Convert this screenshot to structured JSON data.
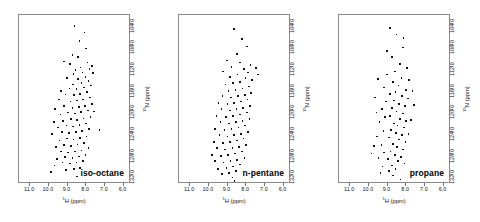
{
  "figure": {
    "panel_count": 3
  },
  "axes": {
    "x_title_pre": "1",
    "x_title_main": "H (ppm)",
    "y_title_pre": "15",
    "y_title_main": "N (ppm)",
    "x_ticks": [
      "11.0",
      "10.0",
      "9.0",
      "8.0",
      "7.0",
      "6.0"
    ],
    "x_tick_values": [
      11.0,
      10.0,
      9.0,
      8.0,
      7.0,
      6.0
    ],
    "y_ticks": [
      "104.0",
      "108.0",
      "112.0",
      "116.0",
      "120.0",
      "124.0",
      "128.0",
      "132.0"
    ],
    "y_tick_values": [
      104.0,
      108.0,
      112.0,
      116.0,
      120.0,
      124.0,
      128.0,
      132.0
    ],
    "x_range": [
      11.6,
      5.6
    ],
    "y_range": [
      102.4,
      133.6
    ],
    "x_inverted": true,
    "y_inverted": true
  },
  "chart_data": {
    "type": "scatter",
    "title": "",
    "xlabel": "1H (ppm)",
    "ylabel": "15N (ppm)",
    "xlim": [
      11.6,
      5.6
    ],
    "ylim": [
      133.6,
      102.4
    ],
    "grid": false,
    "legend": "none",
    "marker": "dot",
    "marker_color": "#111111",
    "panels": [
      {
        "label": "iso-octane",
        "point_count": 96,
        "points": [
          [
            8.62,
            104.4
          ],
          [
            8.1,
            105.6
          ],
          [
            8.36,
            107.2
          ],
          [
            8.02,
            108.6
          ],
          [
            8.74,
            109.8
          ],
          [
            8.45,
            110.2
          ],
          [
            9.18,
            111.0
          ],
          [
            8.86,
            111.4
          ],
          [
            7.92,
            111.2
          ],
          [
            7.7,
            111.8
          ],
          [
            8.3,
            112.1
          ],
          [
            8.58,
            112.6
          ],
          [
            7.82,
            112.4
          ],
          [
            8.2,
            113.0
          ],
          [
            8.68,
            113.3
          ],
          [
            7.62,
            113.1
          ],
          [
            8.04,
            113.8
          ],
          [
            8.44,
            114.2
          ],
          [
            9.02,
            114.0
          ],
          [
            7.88,
            114.6
          ],
          [
            8.26,
            115.0
          ],
          [
            8.72,
            115.2
          ],
          [
            7.74,
            115.4
          ],
          [
            8.12,
            115.8
          ],
          [
            8.52,
            116.1
          ],
          [
            8.9,
            116.0
          ],
          [
            9.34,
            116.4
          ],
          [
            7.96,
            116.6
          ],
          [
            8.34,
            117.0
          ],
          [
            8.66,
            117.2
          ],
          [
            9.1,
            117.1
          ],
          [
            7.8,
            117.6
          ],
          [
            8.18,
            118.0
          ],
          [
            8.5,
            118.2
          ],
          [
            8.84,
            118.4
          ],
          [
            9.46,
            118.0
          ],
          [
            7.68,
            118.8
          ],
          [
            8.06,
            119.2
          ],
          [
            8.4,
            119.4
          ],
          [
            8.74,
            119.6
          ],
          [
            9.2,
            119.2
          ],
          [
            9.66,
            119.8
          ],
          [
            7.9,
            120.0
          ],
          [
            8.28,
            120.3
          ],
          [
            8.6,
            120.6
          ],
          [
            8.96,
            120.4
          ],
          [
            9.38,
            120.8
          ],
          [
            7.76,
            121.2
          ],
          [
            8.14,
            121.5
          ],
          [
            8.48,
            121.8
          ],
          [
            8.82,
            121.6
          ],
          [
            9.24,
            122.0
          ],
          [
            9.72,
            122.2
          ],
          [
            8.0,
            122.4
          ],
          [
            8.36,
            122.7
          ],
          [
            8.7,
            123.0
          ],
          [
            9.06,
            122.8
          ],
          [
            9.52,
            123.2
          ],
          [
            7.84,
            123.4
          ],
          [
            8.22,
            123.8
          ],
          [
            8.56,
            124.0
          ],
          [
            8.92,
            124.2
          ],
          [
            9.3,
            124.0
          ],
          [
            9.84,
            124.4
          ],
          [
            7.98,
            124.8
          ],
          [
            8.34,
            125.1
          ],
          [
            8.68,
            125.4
          ],
          [
            9.04,
            125.2
          ],
          [
            9.44,
            125.6
          ],
          [
            8.12,
            126.0
          ],
          [
            8.46,
            126.3
          ],
          [
            8.8,
            126.6
          ],
          [
            9.18,
            126.4
          ],
          [
            9.62,
            126.8
          ],
          [
            7.88,
            127.0
          ],
          [
            8.26,
            127.4
          ],
          [
            8.6,
            127.6
          ],
          [
            8.96,
            127.8
          ],
          [
            9.36,
            127.6
          ],
          [
            8.04,
            128.2
          ],
          [
            8.4,
            128.5
          ],
          [
            8.74,
            128.8
          ],
          [
            9.12,
            128.6
          ],
          [
            9.56,
            129.0
          ],
          [
            8.18,
            129.4
          ],
          [
            8.52,
            129.6
          ],
          [
            8.88,
            129.8
          ],
          [
            9.28,
            129.6
          ],
          [
            9.7,
            130.2
          ],
          [
            8.32,
            130.6
          ],
          [
            8.66,
            130.8
          ],
          [
            9.08,
            131.0
          ],
          [
            9.9,
            131.4
          ],
          [
            8.48,
            132.2
          ],
          [
            7.28,
            123.6
          ],
          [
            7.58,
            120.2
          ]
        ]
      },
      {
        "label": "n-pentane",
        "point_count": 88,
        "points": [
          [
            8.66,
            105.0
          ],
          [
            8.24,
            106.8
          ],
          [
            7.96,
            108.2
          ],
          [
            8.5,
            109.6
          ],
          [
            9.02,
            110.8
          ],
          [
            8.34,
            111.2
          ],
          [
            7.78,
            111.6
          ],
          [
            8.78,
            112.0
          ],
          [
            8.12,
            112.4
          ],
          [
            9.24,
            112.8
          ],
          [
            7.9,
            113.0
          ],
          [
            8.46,
            113.4
          ],
          [
            8.86,
            113.8
          ],
          [
            8.04,
            114.0
          ],
          [
            7.68,
            114.4
          ],
          [
            8.32,
            114.8
          ],
          [
            8.7,
            115.0
          ],
          [
            9.1,
            115.2
          ],
          [
            7.86,
            115.6
          ],
          [
            8.2,
            116.0
          ],
          [
            8.58,
            116.2
          ],
          [
            8.94,
            116.4
          ],
          [
            7.74,
            116.8
          ],
          [
            8.08,
            117.2
          ],
          [
            8.44,
            117.4
          ],
          [
            8.8,
            117.6
          ],
          [
            9.28,
            117.4
          ],
          [
            7.92,
            118.0
          ],
          [
            8.28,
            118.4
          ],
          [
            8.64,
            118.6
          ],
          [
            9.0,
            118.8
          ],
          [
            9.48,
            118.6
          ],
          [
            7.8,
            119.2
          ],
          [
            8.16,
            119.6
          ],
          [
            8.52,
            119.8
          ],
          [
            8.88,
            120.0
          ],
          [
            9.32,
            119.8
          ],
          [
            7.96,
            120.4
          ],
          [
            8.34,
            120.8
          ],
          [
            8.7,
            121.0
          ],
          [
            9.08,
            121.2
          ],
          [
            9.6,
            121.0
          ],
          [
            7.82,
            121.6
          ],
          [
            8.2,
            122.0
          ],
          [
            8.56,
            122.2
          ],
          [
            8.92,
            122.4
          ],
          [
            9.38,
            122.2
          ],
          [
            8.06,
            122.8
          ],
          [
            8.42,
            123.2
          ],
          [
            8.78,
            123.4
          ],
          [
            9.16,
            123.6
          ],
          [
            9.66,
            123.4
          ],
          [
            7.9,
            124.0
          ],
          [
            8.28,
            124.4
          ],
          [
            8.64,
            124.6
          ],
          [
            9.0,
            124.8
          ],
          [
            9.44,
            124.6
          ],
          [
            8.14,
            125.2
          ],
          [
            8.5,
            125.6
          ],
          [
            8.86,
            125.8
          ],
          [
            9.24,
            126.0
          ],
          [
            9.74,
            125.8
          ],
          [
            8.0,
            126.4
          ],
          [
            8.38,
            126.8
          ],
          [
            8.74,
            127.0
          ],
          [
            9.12,
            127.2
          ],
          [
            9.56,
            127.0
          ],
          [
            8.24,
            127.6
          ],
          [
            8.6,
            128.0
          ],
          [
            8.96,
            128.2
          ],
          [
            9.34,
            128.4
          ],
          [
            9.82,
            128.2
          ],
          [
            8.1,
            128.8
          ],
          [
            8.48,
            129.2
          ],
          [
            8.84,
            129.4
          ],
          [
            9.22,
            129.6
          ],
          [
            9.68,
            129.4
          ],
          [
            8.34,
            130.0
          ],
          [
            8.7,
            130.4
          ],
          [
            9.06,
            130.6
          ],
          [
            9.5,
            130.8
          ],
          [
            8.56,
            131.2
          ],
          [
            8.92,
            131.6
          ],
          [
            9.3,
            131.8
          ],
          [
            8.74,
            132.4
          ],
          [
            7.46,
            112.2
          ],
          [
            7.38,
            113.4
          ],
          [
            8.62,
            133.0
          ]
        ]
      },
      {
        "label": "propane",
        "point_count": 72,
        "points": [
          [
            8.52,
            106.0
          ],
          [
            8.18,
            108.4
          ],
          [
            8.76,
            110.2
          ],
          [
            8.34,
            111.4
          ],
          [
            7.96,
            112.2
          ],
          [
            8.6,
            112.8
          ],
          [
            9.02,
            113.4
          ],
          [
            8.26,
            114.0
          ],
          [
            7.84,
            114.4
          ],
          [
            8.7,
            114.8
          ],
          [
            8.42,
            115.4
          ],
          [
            9.18,
            115.8
          ],
          [
            8.02,
            116.2
          ],
          [
            8.58,
            116.6
          ],
          [
            8.88,
            117.0
          ],
          [
            8.24,
            117.4
          ],
          [
            7.9,
            117.8
          ],
          [
            8.66,
            118.2
          ],
          [
            9.08,
            118.4
          ],
          [
            8.4,
            118.8
          ],
          [
            8.06,
            119.2
          ],
          [
            8.76,
            119.6
          ],
          [
            9.3,
            119.8
          ],
          [
            8.52,
            120.2
          ],
          [
            8.18,
            120.6
          ],
          [
            8.86,
            121.0
          ],
          [
            9.14,
            121.2
          ],
          [
            8.34,
            121.6
          ],
          [
            8.0,
            122.0
          ],
          [
            8.64,
            122.4
          ],
          [
            9.44,
            122.2
          ],
          [
            8.46,
            122.8
          ],
          [
            8.12,
            123.2
          ],
          [
            8.8,
            123.6
          ],
          [
            9.22,
            123.8
          ],
          [
            8.56,
            124.2
          ],
          [
            8.24,
            124.6
          ],
          [
            8.92,
            125.0
          ],
          [
            9.56,
            124.8
          ],
          [
            8.38,
            125.4
          ],
          [
            8.04,
            125.8
          ],
          [
            8.7,
            126.2
          ],
          [
            9.32,
            126.4
          ],
          [
            8.5,
            126.8
          ],
          [
            8.16,
            127.2
          ],
          [
            8.84,
            127.6
          ],
          [
            9.18,
            127.8
          ],
          [
            8.6,
            128.2
          ],
          [
            8.28,
            128.6
          ],
          [
            8.96,
            129.0
          ],
          [
            9.48,
            128.8
          ],
          [
            8.44,
            129.4
          ],
          [
            8.1,
            129.8
          ],
          [
            8.76,
            130.2
          ],
          [
            9.26,
            130.4
          ],
          [
            8.58,
            130.8
          ],
          [
            8.92,
            131.2
          ],
          [
            9.38,
            131.6
          ],
          [
            8.72,
            132.0
          ],
          [
            9.6,
            120.4
          ],
          [
            9.72,
            126.6
          ],
          [
            7.66,
            116.4
          ],
          [
            7.58,
            119.0
          ],
          [
            8.86,
            104.8
          ],
          [
            9.04,
            109.0
          ],
          [
            9.86,
            128.0
          ],
          [
            8.3,
            132.8
          ],
          [
            7.74,
            121.8
          ],
          [
            9.68,
            117.6
          ],
          [
            8.14,
            106.6
          ],
          [
            9.5,
            114.2
          ],
          [
            7.88,
            124.4
          ]
        ]
      }
    ]
  }
}
